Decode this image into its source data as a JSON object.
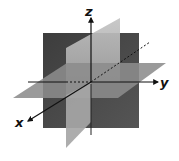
{
  "diagram": {
    "type": "3d-coordinate-planes",
    "axes": {
      "x": {
        "label": "x"
      },
      "y": {
        "label": "y"
      },
      "z": {
        "label": "z"
      }
    },
    "planes": [
      {
        "name": "xz-plane",
        "color": "#4a4a4a"
      },
      {
        "name": "yz-plane",
        "color": "#b3b3b3"
      },
      {
        "name": "xy-plane",
        "color": "#8a8a8a"
      }
    ],
    "colors": {
      "background": "#ffffff",
      "axis": "#111111"
    }
  }
}
